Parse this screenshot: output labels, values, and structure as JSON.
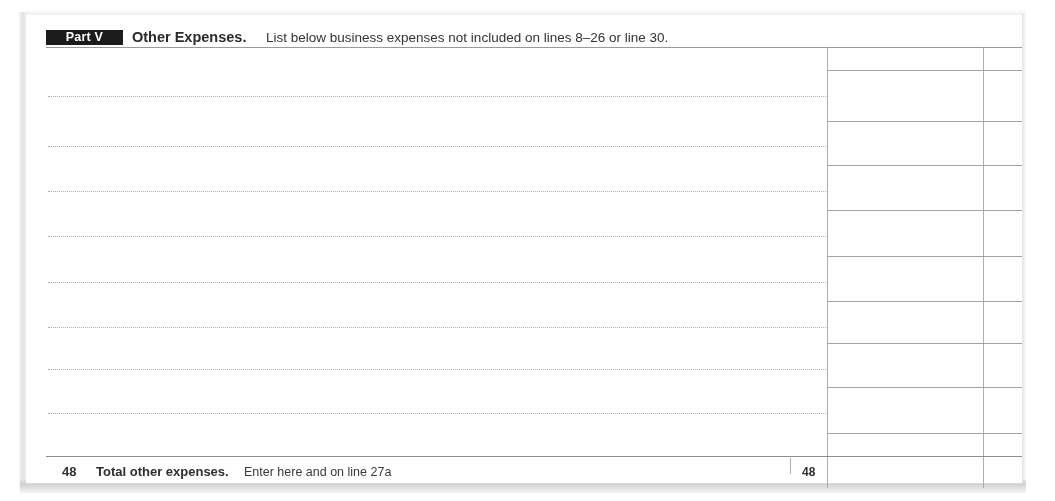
{
  "document": {
    "form_section": "Part V",
    "section_title": "Other Expenses.",
    "section_subtitle": "List below business expenses not included on lines 8–26 or line 30.",
    "blank_entry_rows": 8,
    "entry_rows": [
      {
        "description": "",
        "dollars": "",
        "cents": ""
      },
      {
        "description": "",
        "dollars": "",
        "cents": ""
      },
      {
        "description": "",
        "dollars": "",
        "cents": ""
      },
      {
        "description": "",
        "dollars": "",
        "cents": ""
      },
      {
        "description": "",
        "dollars": "",
        "cents": ""
      },
      {
        "description": "",
        "dollars": "",
        "cents": ""
      },
      {
        "description": "",
        "dollars": "",
        "cents": ""
      },
      {
        "description": "",
        "dollars": "",
        "cents": ""
      }
    ],
    "total_row": {
      "line_number": "48",
      "label": "Total other expenses.",
      "instruction": "Enter here and on line 27a",
      "line_number_right": "48",
      "dollars": "",
      "cents": ""
    }
  },
  "colors": {
    "badge_background": "#1b1b1b",
    "badge_text": "#ffffff",
    "ink": "#2f2f2f",
    "rule": "#9a9a9a",
    "page": "#ffffff"
  }
}
